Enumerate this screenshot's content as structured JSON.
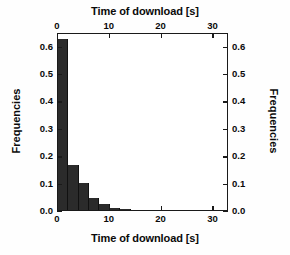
{
  "chart_data": {
    "type": "bar",
    "title": "",
    "xlabel": "Time of download [s]",
    "ylabel": "Frequencies",
    "xlabel_top": "Time of download [s]",
    "ylabel_right": "Frequencies",
    "xlim": [
      0,
      33
    ],
    "ylim": [
      0.0,
      0.65
    ],
    "grid": false,
    "legend": false,
    "bar_color": "#2b2b2b",
    "axis_color": "#1a1a1a",
    "bin_width": 2,
    "xticks": [
      0,
      10,
      20,
      30
    ],
    "xticklabels": [
      "0",
      "10",
      "20",
      "30"
    ],
    "yticks": [
      0.0,
      0.1,
      0.2,
      0.3,
      0.4,
      0.5,
      0.6
    ],
    "yticklabels": [
      "0.0",
      "0.1",
      "0.2",
      "0.3",
      "0.4",
      "0.5",
      "0.6"
    ],
    "bins": [
      {
        "start": 0,
        "end": 2,
        "value": 0.625
      },
      {
        "start": 2,
        "end": 4,
        "value": 0.165
      },
      {
        "start": 4,
        "end": 6,
        "value": 0.1
      },
      {
        "start": 6,
        "end": 8,
        "value": 0.045
      },
      {
        "start": 8,
        "end": 10,
        "value": 0.022
      },
      {
        "start": 10,
        "end": 12,
        "value": 0.008
      },
      {
        "start": 12,
        "end": 14,
        "value": 0.005
      }
    ],
    "categories": [
      "0-2",
      "2-4",
      "4-6",
      "6-8",
      "8-10",
      "10-12",
      "12-14"
    ],
    "values": [
      0.625,
      0.165,
      0.1,
      0.045,
      0.022,
      0.008,
      0.005
    ]
  }
}
